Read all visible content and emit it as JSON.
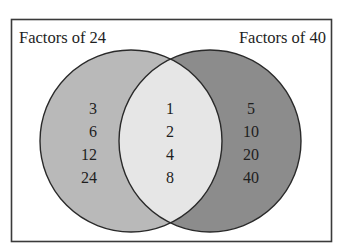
{
  "diagram": {
    "type": "venn",
    "sets": [
      {
        "label": "Factors of 24",
        "only": [
          "3",
          "6",
          "12",
          "24"
        ],
        "color": "#b9b9b9"
      },
      {
        "label": "Factors of 40",
        "only": [
          "5",
          "10",
          "20",
          "40"
        ],
        "color": "#8c8c8c"
      }
    ],
    "intersection": {
      "values": [
        "1",
        "2",
        "4",
        "8"
      ],
      "color": "#e6e6e6"
    },
    "border_color": "#3a3a3a",
    "background": "#ffffff"
  }
}
